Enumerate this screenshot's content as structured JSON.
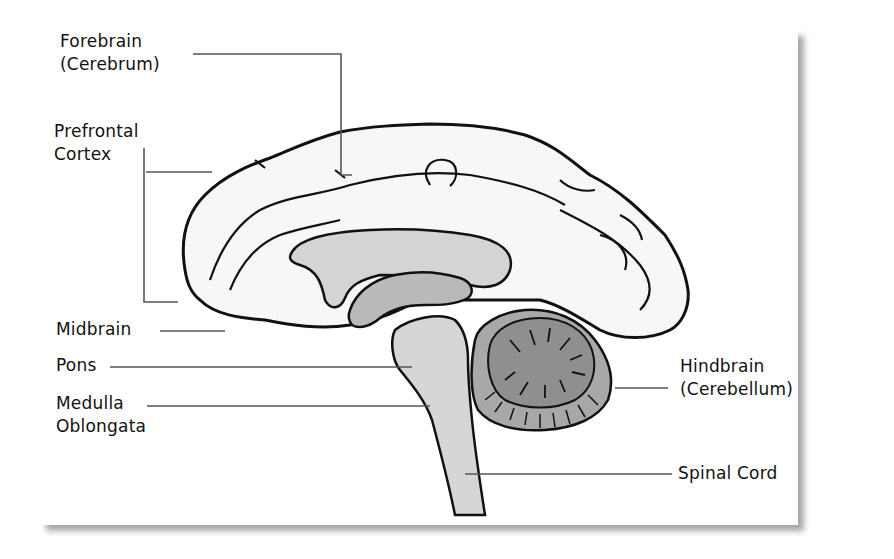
{
  "diagram": {
    "labels": {
      "forebrain_line1": "Forebrain",
      "forebrain_line2": "(Cerebrum)",
      "prefrontal_line1": "Prefrontal",
      "prefrontal_line2": "Cortex",
      "midbrain": "Midbrain",
      "pons": "Pons",
      "medulla_line1": "Medulla",
      "medulla_line2": "Oblongata",
      "hindbrain_line1": "Hindbrain",
      "hindbrain_line2": "(Cerebellum)",
      "spinal_cord": "Spinal Cord"
    },
    "colors": {
      "outline": "#111111",
      "leader_line": "#555555",
      "cerebrum_fill": "#f7f7f7",
      "corpus_callosum_fill": "#d4d4d4",
      "thalamus_fill": "#b9b9b9",
      "brainstem_fill": "#d6d6d6",
      "cerebellum_fill": "#8f8f8f",
      "cerebellum_outer_fill": "#a8a8a8"
    }
  }
}
